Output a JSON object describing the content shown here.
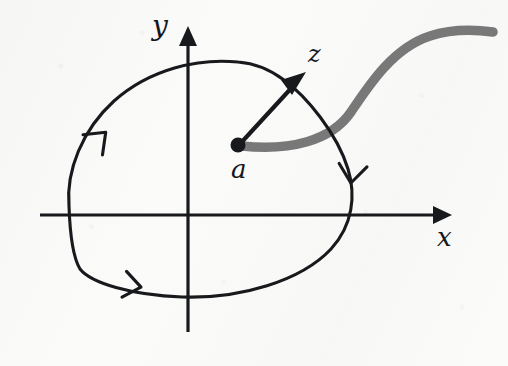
{
  "figure": {
    "kind": "complex-plane-contour-diagram",
    "background_color": "#fbfbfa",
    "ink_color": "#18191c",
    "branch_cut_color": "#6e6e6e"
  },
  "axes": {
    "x_label": "x",
    "y_label": "y",
    "origin": {
      "x": 188,
      "y": 215
    },
    "x_axis": {
      "start_x": 40,
      "end_x": 452,
      "y": 215,
      "arrow": "right"
    },
    "y_axis": {
      "x": 188,
      "start_y": 330,
      "end_y": 26,
      "arrow": "up"
    }
  },
  "points": [
    {
      "name": "branch-point",
      "label": "a",
      "x": 238,
      "y": 144,
      "radius": 7,
      "label_x": 231,
      "label_y": 156
    }
  ],
  "vector": {
    "name": "z-vector",
    "label": "z",
    "from": {
      "x": 238,
      "y": 144
    },
    "to": {
      "x": 306,
      "y": 72
    },
    "label_x": 308,
    "label_y": 42
  },
  "branch_cut": {
    "name": "branch-cut",
    "color": "#6e6e6e",
    "width": 9,
    "description": "S-shaped gray curve from the branch point a running to the right edge",
    "path": "M 244 146 C 290 150, 330 140, 350 112 C 368 86, 392 48, 430 36 C 455 28, 478 30, 493 32"
  },
  "contour": {
    "name": "closed-contour",
    "color": "#18191c",
    "width": 3,
    "orientation": "clockwise",
    "description": "closed black loop encircling the branch point a and crossing the branch cut",
    "path": "M 238 62 C 196 58, 148 70, 112 103 C 80 132, 66 172, 69 207 C 71 238, 74 258, 80 268 C 90 282, 130 294, 180 297 C 238 300, 300 282, 330 250 C 352 226, 355 196, 348 170 C 338 134, 306 96, 284 80 C 268 68, 252 63, 238 62 Z",
    "arrowheads": [
      {
        "name": "contour-arrow-upper-left",
        "x": 104,
        "y": 134,
        "angle_deg": -46
      },
      {
        "name": "contour-arrow-right",
        "x": 352,
        "y": 180,
        "angle_deg": 96
      },
      {
        "name": "contour-arrow-bottom",
        "x": 136,
        "y": 288,
        "angle_deg": 8
      }
    ]
  }
}
